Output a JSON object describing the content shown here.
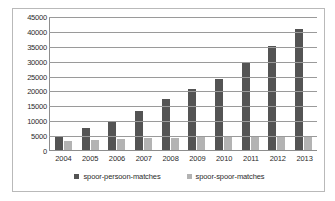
{
  "chart_data": {
    "type": "bar",
    "title": "",
    "xlabel": "",
    "ylabel": "",
    "ylim": [
      0,
      45000
    ],
    "ytick_step": 5000,
    "grid": true,
    "legend_position": "bottom",
    "categories": [
      "2004",
      "2005",
      "2006",
      "2007",
      "2008",
      "2009",
      "2010",
      "2011",
      "2012",
      "2013"
    ],
    "yticks": [
      "45000",
      "40000",
      "35000",
      "30000",
      "25000",
      "20000",
      "15000",
      "10000",
      "5000",
      "0"
    ],
    "series": [
      {
        "name": "spoor-persoon-matches",
        "color": "#545454",
        "values": [
          4600,
          7400,
          9700,
          13000,
          17000,
          20500,
          24000,
          29200,
          35000,
          40700
        ]
      },
      {
        "name": "spoor-spoor-matches",
        "color": "#b3b3b3",
        "values": [
          2900,
          3300,
          3700,
          4000,
          4200,
          4400,
          4400,
          4400,
          4300,
          4300
        ]
      }
    ]
  }
}
